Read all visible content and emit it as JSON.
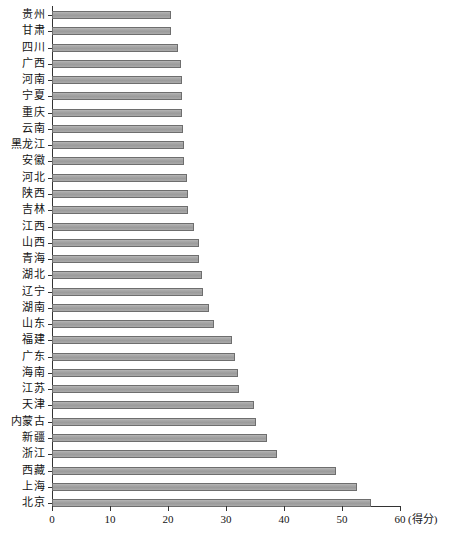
{
  "chart_data": {
    "type": "bar",
    "orientation": "horizontal",
    "title": "",
    "subtitle": "",
    "xlabel": "(得分)",
    "ylabel": "",
    "xlim": [
      0,
      60
    ],
    "xticks": [
      0,
      10,
      20,
      30,
      40,
      50,
      60
    ],
    "xtick_labels": [
      "0",
      "10",
      "20",
      "30",
      "40",
      "50",
      "60"
    ],
    "grid": false,
    "legend": false,
    "bar_color": "#a6a6a6",
    "bar_edge_color": "#6e6e6e",
    "axis_color": "#333333",
    "categories": [
      "贵州",
      "甘肃",
      "四川",
      "广西",
      "河南",
      "宁夏",
      "重庆",
      "云南",
      "黑龙江",
      "安徽",
      "河北",
      "陕西",
      "吉林",
      "江西",
      "山西",
      "青海",
      "湖北",
      "辽宁",
      "湖南",
      "山东",
      "福建",
      "广东",
      "海南",
      "江苏",
      "天津",
      "内蒙古",
      "新疆",
      "浙江",
      "西藏",
      "上海",
      "北京"
    ],
    "values": [
      20.5,
      20.5,
      21.7,
      22.2,
      22.4,
      22.4,
      22.4,
      22.6,
      22.8,
      22.8,
      23.3,
      23.5,
      23.5,
      24.5,
      25.3,
      25.3,
      25.9,
      26.0,
      27.0,
      28.0,
      31.0,
      31.5,
      32.0,
      32.2,
      34.8,
      35.2,
      37.0,
      38.8,
      49.0,
      52.5,
      55.0
    ],
    "caption": ""
  },
  "axis": {
    "unit_label": "(得分)"
  }
}
